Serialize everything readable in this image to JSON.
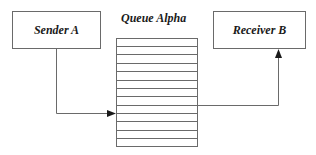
{
  "diagram": {
    "sender": {
      "label": "Sender A"
    },
    "queue": {
      "label": "Queue Alpha",
      "slots": 13
    },
    "receiver": {
      "label": "Receiver B"
    },
    "edges": [
      {
        "from": "Sender A",
        "to": "Queue Alpha"
      },
      {
        "from": "Queue Alpha",
        "to": "Receiver B"
      }
    ],
    "colors": {
      "stroke": "#6a6a6a",
      "arrow": "#1a1a1a",
      "text": "#1a1a1a"
    }
  }
}
